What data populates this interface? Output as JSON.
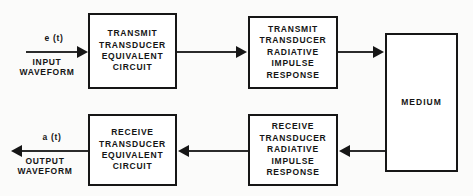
{
  "diagram": {
    "background_color": "#fbfbfa",
    "line_color": "#161616",
    "box_fill": "#ffffff",
    "blocks": [
      {
        "name": "transmit-transducer-equivalent-circuit",
        "lines": [
          "TRANSMIT",
          "TRANSDUCER",
          "EQUIVALENT",
          "CIRCUIT"
        ]
      },
      {
        "name": "transmit-transducer-radiative-impulse-response",
        "lines": [
          "TRANSMIT",
          "TRANSDUCER",
          "RADIATIVE",
          "IMPULSE",
          "RESPONSE"
        ]
      },
      {
        "name": "medium",
        "lines": [
          "MEDIUM"
        ]
      },
      {
        "name": "receive-transducer-equivalent-circuit",
        "lines": [
          "RECEIVE",
          "TRANSDUCER",
          "EQUIVALENT",
          "CIRCUIT"
        ]
      },
      {
        "name": "receive-transducer-radiative-impulse-response",
        "lines": [
          "RECEIVE",
          "TRANSDUCER",
          "RADIATIVE",
          "IMPULSE",
          "RESPONSE"
        ]
      }
    ],
    "signals": {
      "input": {
        "symbol": "e (t)",
        "caption_line1": "INPUT",
        "caption_line2": "WAVEFORM",
        "direction": "right"
      },
      "output": {
        "symbol": "a (t)",
        "caption_line1": "OUTPUT",
        "caption_line2": "WAVEFORM",
        "direction": "left"
      }
    },
    "connectors": [
      {
        "name": "input-to-transmit-equivalent-circuit",
        "direction": "right"
      },
      {
        "name": "transmit-equivalent-to-transmit-radiative",
        "direction": "right"
      },
      {
        "name": "transmit-radiative-to-medium",
        "direction": "right"
      },
      {
        "name": "medium-to-receive-radiative",
        "direction": "left"
      },
      {
        "name": "receive-radiative-to-receive-equivalent",
        "direction": "left"
      },
      {
        "name": "receive-equivalent-to-output",
        "direction": "left"
      }
    ]
  }
}
